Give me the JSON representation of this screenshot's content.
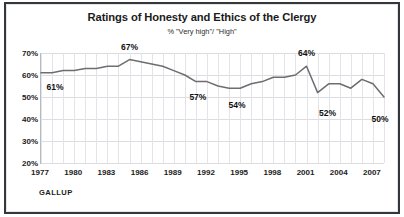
{
  "chart_data": {
    "type": "line",
    "title": "Ratings of Honesty and Ethics of the Clergy",
    "subtitle": "% \"Very high\"/ \"High\"",
    "xlabel": "",
    "ylabel": "",
    "ylim": [
      20,
      70
    ],
    "xlim": [
      1977,
      2008
    ],
    "ytick_labels": [
      "70%",
      "60%",
      "50%",
      "40%",
      "30%",
      "20%"
    ],
    "ytick_values": [
      70,
      60,
      50,
      40,
      30,
      20
    ],
    "xtick_labels": [
      "1977",
      "1980",
      "1983",
      "1986",
      "1989",
      "1992",
      "1995",
      "1998",
      "2001",
      "2004",
      "2007"
    ],
    "xtick_values": [
      1977,
      1980,
      1983,
      1986,
      1989,
      1992,
      1995,
      1998,
      2001,
      2004,
      2007
    ],
    "grid": true,
    "legend": "none",
    "line_color": "#6e6e70",
    "x": [
      1977,
      1978,
      1979,
      1980,
      1981,
      1982,
      1983,
      1984,
      1985,
      1986,
      1987,
      1988,
      1989,
      1990,
      1991,
      1992,
      1993,
      1994,
      1995,
      1996,
      1997,
      1998,
      1999,
      2000,
      2001,
      2002,
      2003,
      2004,
      2005,
      2006,
      2007,
      2008
    ],
    "values": [
      61,
      61,
      62,
      62,
      63,
      63,
      64,
      64,
      67,
      66,
      65,
      64,
      62,
      60,
      57,
      57,
      55,
      54,
      54,
      56,
      57,
      59,
      59,
      60,
      64,
      52,
      56,
      56,
      54,
      58,
      56,
      50
    ],
    "point_labels": [
      {
        "year": 1977,
        "value": 61,
        "text": "61%"
      },
      {
        "year": 1985,
        "value": 67,
        "text": "67%"
      },
      {
        "year": 1991,
        "value": 57,
        "text": "57%"
      },
      {
        "year": 1994,
        "value": 54,
        "text": "54%"
      },
      {
        "year": 2001,
        "value": 64,
        "text": "64%"
      },
      {
        "year": 2002,
        "value": 52,
        "text": "52%"
      },
      {
        "year": 2008,
        "value": 50,
        "text": "50%"
      }
    ]
  },
  "branding": {
    "name": "GALLUP"
  }
}
